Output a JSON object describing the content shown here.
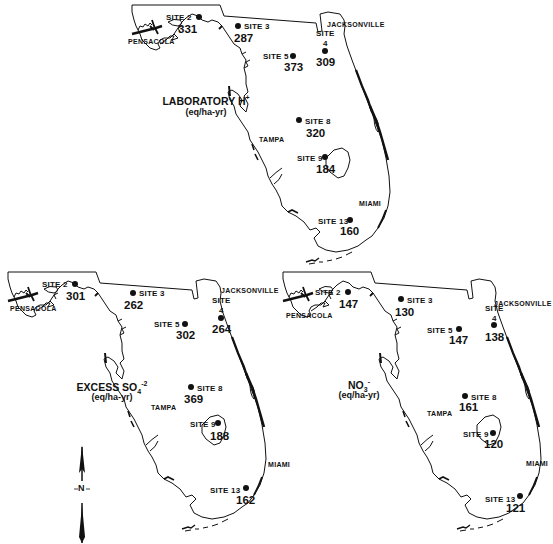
{
  "figure": {
    "type": "map_figure",
    "region": "Florida",
    "colors": {
      "ink": "#111111",
      "background": "#ffffff"
    }
  },
  "maps": [
    {
      "id": "laboratory-h",
      "title": "LABORATORY H",
      "title_superscript": "+",
      "units": "(eq/ha-yr)",
      "cities": {
        "pensacola": "PENSACOLA",
        "jacksonville": "JACKSONVILLE",
        "tampa": "TAMPA",
        "miami": "MIAMI"
      },
      "sites": [
        {
          "label": "SITE 2",
          "value": "331"
        },
        {
          "label": "SITE 3",
          "value": "287"
        },
        {
          "label": "SITE",
          "label2": "4",
          "value": "309"
        },
        {
          "label": "SITE 5",
          "value": "373"
        },
        {
          "label": "SITE 8",
          "value": "320"
        },
        {
          "label": "SITE 9",
          "value": "184"
        },
        {
          "label": "SITE 13",
          "value": "160"
        }
      ]
    },
    {
      "id": "excess-so4",
      "title": "EXCESS SO",
      "title_subscript": "4",
      "title_superscript": "-2",
      "units": "(eq/ha-yr)",
      "cities": {
        "pensacola": "PENSACOLA",
        "jacksonville": "JACKSONVILLE",
        "tampa": "TAMPA",
        "miami": "MIAMI"
      },
      "sites": [
        {
          "label": "SITE 2",
          "value": "301"
        },
        {
          "label": "SITE 3",
          "value": "262"
        },
        {
          "label": "SITE",
          "label2": "4",
          "value": "264"
        },
        {
          "label": "SITE 5",
          "value": "302"
        },
        {
          "label": "SITE 8",
          "value": "369"
        },
        {
          "label": "SITE 9",
          "value": "188"
        },
        {
          "label": "SITE 13",
          "value": "162"
        }
      ]
    },
    {
      "id": "no3",
      "title": "NO",
      "title_subscript": "3",
      "title_superscript": "-",
      "units": "(eq/ha-yr)",
      "cities": {
        "pensacola": "PENSACOLA",
        "jacksonville": "JACKSONVILLE",
        "tampa": "TAMPA",
        "miami": "MIAMI"
      },
      "sites": [
        {
          "label": "SITE 2",
          "value": "147"
        },
        {
          "label": "SITE 3",
          "value": "130"
        },
        {
          "label": "SITE",
          "label2": "4",
          "value": "138"
        },
        {
          "label": "SITE 5",
          "value": "147"
        },
        {
          "label": "SITE 8",
          "value": "161"
        },
        {
          "label": "SITE 9",
          "value": "120"
        },
        {
          "label": "SITE 13",
          "value": "121"
        }
      ]
    }
  ],
  "north_arrow": {
    "label": "N"
  }
}
